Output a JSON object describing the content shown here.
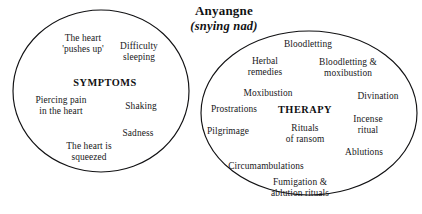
{
  "title": {
    "main": "Anyangne",
    "sub": "(snying nad)"
  },
  "groups": [
    {
      "id": "symptoms",
      "center_label": "SYMPTOMS",
      "items": [
        "The heart\n'pushes up'",
        "Difficulty\nsleeping",
        "Piercing pain\nin the heart",
        "Shaking",
        "Sadness",
        "The heart is\nsqueezed"
      ]
    },
    {
      "id": "therapy",
      "center_label": "THERAPY",
      "items": [
        "Bloodletting",
        "Herbal\nremedies",
        "Bloodletting &\nmoxibustion",
        "Moxibustion",
        "Divination",
        "Prostrations",
        "Incense\nritual",
        "Pilgrimage",
        "Rituals\nof ransom",
        "Ablutions",
        "Circumambulations",
        "Fumigation &\nablution rituals"
      ]
    }
  ],
  "style": {
    "stroke": "#111113",
    "background": "#ffffff"
  }
}
